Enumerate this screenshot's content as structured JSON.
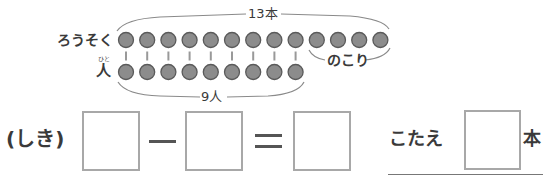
{
  "diagram": {
    "candles_label": "ろうそく",
    "people_label": "人",
    "people_furigana": "ひと",
    "total_label": "13本",
    "people_count_label": "9人",
    "remaining_label": "のこり",
    "candle_count": 13,
    "people_count": 9,
    "circle_color": "#8c8c8c",
    "circle_stroke": "#5a5a5a"
  },
  "equation": {
    "prefix_label": "(しき)",
    "operator_minus": "−",
    "operator_equals": "=",
    "box_1_value": "",
    "box_2_value": "",
    "box_3_value": ""
  },
  "answer": {
    "label": "こたえ",
    "value": "",
    "unit": "本"
  }
}
